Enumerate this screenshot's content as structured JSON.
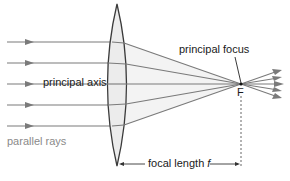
{
  "diagram": {
    "labels": {
      "principal_axis": "principal axis",
      "principal_focus": "principal focus",
      "focus_point": "F",
      "parallel_rays": "parallel rays",
      "focal_length": "focal length",
      "focal_length_symbol": "f"
    },
    "colors": {
      "ray": "#7a7a7a",
      "lens_fill": "#ececec",
      "lens_stroke": "#3a3a3a",
      "cone_fill": "#f3f3f3",
      "text_dark": "#1a1a1a",
      "text_grey": "#8a8a8a",
      "guide": "#555555"
    },
    "rays": {
      "count": 5,
      "y_positions": [
        42,
        63,
        84,
        105,
        126
      ]
    }
  }
}
